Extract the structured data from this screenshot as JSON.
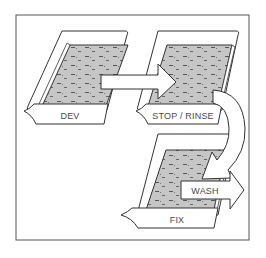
{
  "diagram": {
    "type": "process-flow",
    "steps": [
      {
        "id": "dev",
        "label": "DEV"
      },
      {
        "id": "stop",
        "label": "STOP / RINSE"
      },
      {
        "id": "fix",
        "label": "FIX"
      },
      {
        "id": "wash",
        "label": "WASH"
      }
    ],
    "arrows": [
      {
        "from": "dev",
        "to": "stop",
        "shape": "straight"
      },
      {
        "from": "stop",
        "to": "fix",
        "shape": "curved"
      },
      {
        "from": "fix",
        "to": "wash",
        "shape": "straight",
        "label": "WASH"
      }
    ],
    "colors": {
      "frame": "#555555",
      "outline": "#333333",
      "liquid": "#c8c8c8",
      "background": "#ffffff"
    }
  }
}
